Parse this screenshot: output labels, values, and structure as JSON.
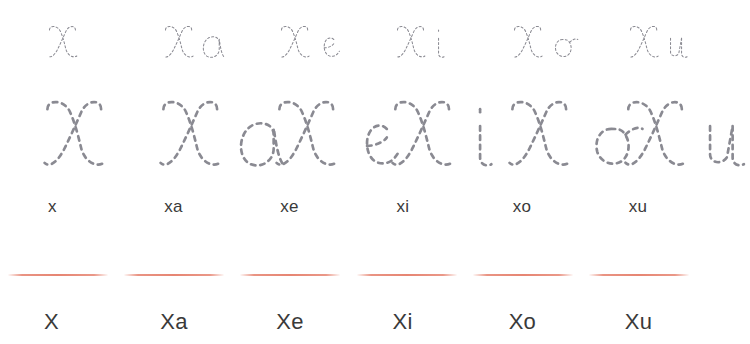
{
  "worksheet": {
    "letter": "X",
    "columns": [
      {
        "id": "x",
        "trace_small_label": "x",
        "trace_large_label": "x",
        "lower_label": "x",
        "upper_label": "X",
        "has_rule": true
      },
      {
        "id": "xa",
        "trace_small_label": "xa",
        "trace_large_label": "xa",
        "lower_label": "xa",
        "upper_label": "Xa",
        "has_rule": true
      },
      {
        "id": "xe",
        "trace_small_label": "xe",
        "trace_large_label": "xe",
        "lower_label": "xe",
        "upper_label": "Xe",
        "has_rule": true
      },
      {
        "id": "xi",
        "trace_small_label": "xi",
        "trace_large_label": "xi",
        "lower_label": "xi",
        "upper_label": "Xi",
        "has_rule": true
      },
      {
        "id": "xo",
        "trace_small_label": "xo",
        "trace_large_label": "xo",
        "lower_label": "xo",
        "upper_label": "Xo",
        "has_rule": true
      },
      {
        "id": "xu",
        "trace_small_label": "xu",
        "trace_large_label": "xu",
        "lower_label": "xu",
        "upper_label": "Xu",
        "has_rule": true
      }
    ],
    "colors": {
      "background": "#ffffff",
      "trace_stroke": "#8a8a92",
      "rule_line": "#e2705a",
      "label_text": "#3a3a3a"
    }
  }
}
